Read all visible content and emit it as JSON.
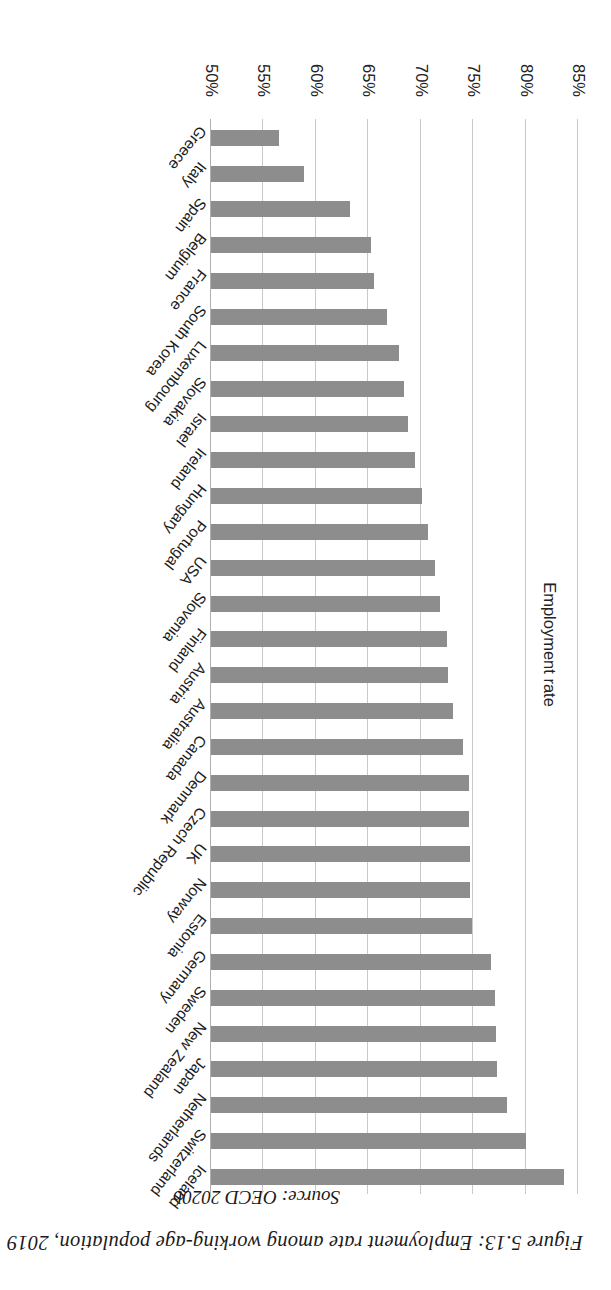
{
  "figure": {
    "caption": "Figure 5.13: Employment rate among working-age population, 2019",
    "source": "Source: OECD 2020b"
  },
  "chart_data": {
    "type": "bar",
    "orientation": "vertical-columns-rendered-rotated",
    "title": "Employment rate among working-age population, 2019",
    "xlabel": "",
    "ylabel": "Employment rate",
    "ylim": [
      50,
      85
    ],
    "ytick_labels": [
      "50%",
      "55%",
      "60%",
      "65%",
      "70%",
      "75%",
      "80%",
      "85%"
    ],
    "yticks": [
      50,
      55,
      60,
      65,
      70,
      75,
      80,
      85
    ],
    "grid": true,
    "legend": "none",
    "bar_color": "#8d8d8d",
    "categories": [
      "Iceland",
      "Switzerland",
      "Netherlands",
      "Japan",
      "New Zealand",
      "Sweden",
      "Germany",
      "Estonia",
      "Norway",
      "UK",
      "Czech Republic",
      "Denmark",
      "Canada",
      "Australia",
      "Austria",
      "Finland",
      "Slovenia",
      "USA",
      "Portugal",
      "Hungary",
      "Ireland",
      "Israel",
      "Slovakia",
      "Luxembourg",
      "South Korea",
      "France",
      "Belgium",
      "Spain",
      "Italy",
      "Greece"
    ],
    "values": [
      83.7,
      80.0,
      78.2,
      77.3,
      77.2,
      77.1,
      76.7,
      74.9,
      74.7,
      74.7,
      74.6,
      74.6,
      74.0,
      73.1,
      72.6,
      72.5,
      71.8,
      71.4,
      70.7,
      70.1,
      69.5,
      68.8,
      68.4,
      67.9,
      66.8,
      65.5,
      65.3,
      63.3,
      58.9,
      56.5
    ],
    "value_unit": "%"
  },
  "axis": {
    "y_title": "Employment rate"
  }
}
